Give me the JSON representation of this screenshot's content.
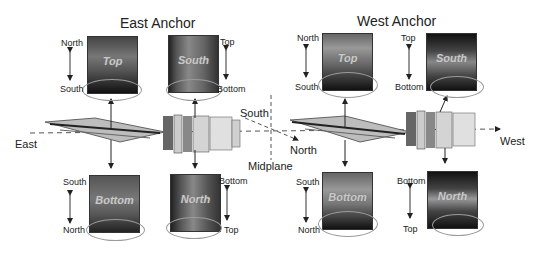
{
  "titles": {
    "east": "East Anchor",
    "west": "West Anchor"
  },
  "axis_labels": {
    "east": "East",
    "west": "West",
    "south": "South",
    "north": "North",
    "midplane": "Midplane"
  },
  "panels": {
    "east_top": {
      "label": "Top",
      "upper": "North",
      "lower": "South",
      "side": "left"
    },
    "east_south": {
      "label": "South",
      "upper": "Top",
      "lower": "Bottom",
      "side": "right"
    },
    "east_bottom": {
      "label": "Bottom",
      "upper": "South",
      "lower": "North",
      "side": "left"
    },
    "east_north": {
      "label": "North",
      "upper": "Bottom",
      "lower": "Top",
      "side": "right"
    },
    "west_top": {
      "label": "Top",
      "upper": "North",
      "lower": "South",
      "side": "left"
    },
    "west_south": {
      "label": "South",
      "upper": "Top",
      "lower": "Bottom",
      "side": "left"
    },
    "west_bottom": {
      "label": "Bottom",
      "upper": "South",
      "lower": "North",
      "side": "left"
    },
    "west_north": {
      "label": "North",
      "upper": "Bottom",
      "lower": "Top",
      "side": "left"
    }
  },
  "colors": {
    "arrow": "#222222",
    "ellipse": "#9a9a9a",
    "dash": "#555555",
    "panel_text": "#c8c8c8"
  }
}
